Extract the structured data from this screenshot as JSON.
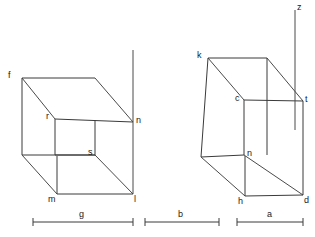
{
  "figure": {
    "type": "geometry-diagram",
    "background_color": "#ffffff",
    "line_color": "#3a3a3a",
    "text_color": "#1a1a1a"
  },
  "axis": {
    "label": "z",
    "label_x": 297,
    "label_y": 3,
    "line_x": 295,
    "line_top": 10,
    "line_bottom": 130
  },
  "left_cube": {
    "name": "left-cube",
    "vertices": [
      {
        "id": "f",
        "label": "f",
        "x": 22,
        "y": 78,
        "label_x": 8,
        "label_y": 71
      },
      {
        "id": "r",
        "label": "r",
        "x": 55,
        "y": 119,
        "label_x": 46,
        "label_y": 112
      },
      {
        "id": "n",
        "label": "n",
        "x": 133,
        "y": 122,
        "label_x": 136,
        "label_y": 116
      },
      {
        "id": "s",
        "label": "s",
        "x": 95,
        "y": 155,
        "label_x": 88,
        "label_y": 148
      },
      {
        "id": "m",
        "label": "m",
        "x": 57,
        "y": 194,
        "label_x": 48,
        "label_y": 195
      },
      {
        "id": "l",
        "label": "l",
        "x": 133,
        "y": 194,
        "label_x": 134,
        "label_y": 195
      }
    ],
    "unlabeled_vertices": [
      {
        "id": "top_right_back",
        "x": 95,
        "y": 78
      },
      {
        "id": "left_bottom_back",
        "x": 22,
        "y": 155
      }
    ]
  },
  "right_cube": {
    "name": "right-cube",
    "vertices": [
      {
        "id": "k",
        "label": "k",
        "x": 208,
        "y": 58,
        "label_x": 197,
        "label_y": 51
      },
      {
        "id": "c",
        "label": "c",
        "x": 244,
        "y": 100,
        "label_x": 235,
        "label_y": 94
      },
      {
        "id": "t",
        "label": "t",
        "x": 303,
        "y": 101,
        "label_x": 305,
        "label_y": 95
      },
      {
        "id": "n2",
        "label": "n",
        "x": 244,
        "y": 155,
        "label_x": 247,
        "label_y": 149
      },
      {
        "id": "h",
        "label": "h",
        "x": 245,
        "y": 196,
        "label_x": 238,
        "label_y": 197
      },
      {
        "id": "d",
        "label": "d",
        "x": 303,
        "y": 195,
        "label_x": 304,
        "label_y": 196
      }
    ],
    "unlabeled_vertices": [
      {
        "id": "top_right_back",
        "x": 267,
        "y": 58
      },
      {
        "id": "left_bottom_back",
        "x": 201,
        "y": 157
      }
    ]
  },
  "dimensions": [
    {
      "id": "g",
      "label": "g",
      "x1": 33,
      "x2": 133,
      "y": 222,
      "label_x": 79,
      "label_y": 210
    },
    {
      "id": "b",
      "label": "b",
      "x1": 145,
      "x2": 219,
      "y": 222,
      "label_x": 178,
      "label_y": 210
    },
    {
      "id": "a",
      "label": "a",
      "x1": 237,
      "x2": 303,
      "y": 222,
      "label_x": 267,
      "label_y": 210
    }
  ]
}
